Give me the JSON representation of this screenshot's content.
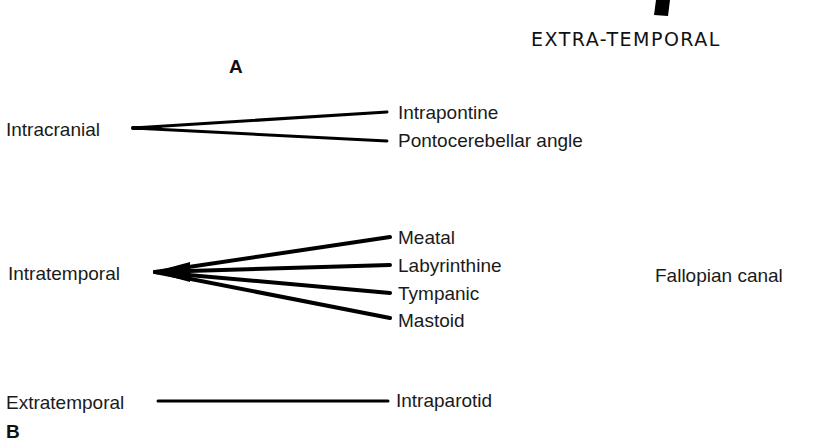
{
  "top_fragment": {
    "heading": "EXTRA-TEMPORAL",
    "marker_shape": "black-bar-fragment"
  },
  "panel_a": {
    "letter": "A"
  },
  "panel_b": {
    "letter": "B",
    "groups": [
      {
        "source": "Intracranial",
        "branches": [
          "Intrapontine",
          "Pontocerebellar angle"
        ]
      },
      {
        "source": "Intratemporal",
        "branches": [
          "Meatal",
          "Labyrinthine",
          "Tympanic",
          "Mastoid"
        ],
        "side_label": "Fallopian canal"
      },
      {
        "source": "Extratemporal",
        "branches": [
          "Intraparotid"
        ]
      }
    ]
  },
  "colors": {
    "line": "#000000",
    "text": "#1a1a1a",
    "background": "#ffffff"
  }
}
